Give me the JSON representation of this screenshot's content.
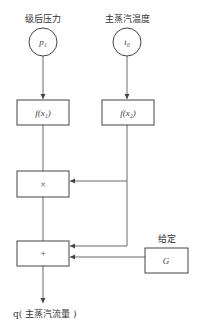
{
  "diagram": {
    "inputs": [
      {
        "label": "级后压力",
        "symbol": "p₁"
      },
      {
        "label": "主蒸汽温度",
        "symbol": "t₀"
      }
    ],
    "functions": [
      {
        "label": "f(x₁)"
      },
      {
        "label": "f(x₂)"
      }
    ],
    "multiplier": {
      "label": "×"
    },
    "adder": {
      "label": "+"
    },
    "setpoint": {
      "title": "给定",
      "symbol": "G"
    },
    "output": {
      "label": "q( 主蒸汽流量 )"
    }
  },
  "colors": {
    "line": "#444444",
    "text": "#333333",
    "background": "#ffffff"
  }
}
